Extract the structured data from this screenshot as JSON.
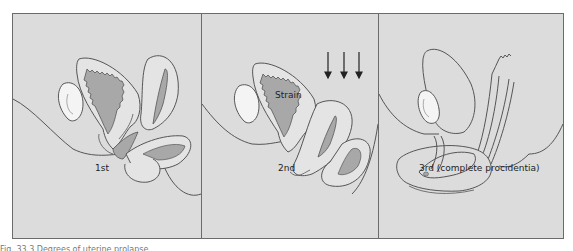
{
  "figure": {
    "panels": [
      {
        "label": "1st"
      },
      {
        "label": "2nd",
        "annotation": "Strain"
      },
      {
        "label": "3rd (complete procidentia)"
      }
    ],
    "caption": "Fig. 33.3 Degrees of uterine prolapse."
  },
  "colors": {
    "background": "#dcdcdc",
    "line": "#555555",
    "tissue_dark": "#a8a8a8",
    "tissue_light": "#e4e4e4",
    "bone": "#f4f4f4"
  }
}
